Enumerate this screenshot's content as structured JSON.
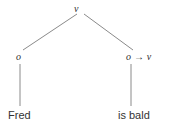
{
  "diagram": {
    "kind": "semantic-parse-tree",
    "background_color": "#ffffff",
    "edge_color": "#8a8a8a",
    "text_color": "#2e2e2e",
    "nodes": {
      "root": {
        "label": "v"
      },
      "left_child": {
        "label": "o"
      },
      "right_child": {
        "label": "o → v"
      },
      "left_leaf": {
        "label": "Fred"
      },
      "right_leaf": {
        "label": "is bald"
      }
    }
  }
}
